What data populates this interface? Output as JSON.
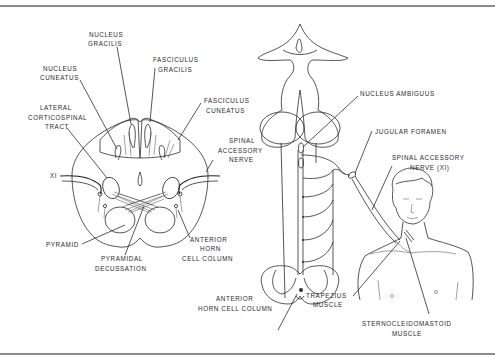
{
  "figure": {
    "type": "anatomical line diagram",
    "panels": [
      "spinal cord cross-section (upper cervical / lower medulla)",
      "brainstem with spinal accessory nerve course",
      "human torso showing trapezius and sternocleidomastoid"
    ]
  },
  "labels": {
    "nucleus_gracilis": [
      "NUCLEUS",
      "GRACILIS"
    ],
    "fasciculus_gracilis": [
      "FASCICULUS",
      "GRACILIS"
    ],
    "nucleus_cuneatus": [
      "NUCLEUS",
      "CUNEATUS"
    ],
    "fasciculus_cuneatus": [
      "FASCICULUS",
      "CUNEATUS"
    ],
    "lateral_corticospinal_tract": [
      "LATERAL",
      "CORTICOSPINAL",
      "TRACT"
    ],
    "spinal_accessory_nerve_left": [
      "SPINAL",
      "ACCESSORY",
      "NERVE"
    ],
    "xi": "XI",
    "pyramid": "PYRAMID",
    "pyramidal_decussation": [
      "PYRAMIDAL",
      "DECUSSATION"
    ],
    "anterior_horn_cell_column_left": [
      "ANTERIOR",
      "HORN",
      "CELL COLUMN"
    ],
    "nucleus_ambiguus": "NUCLEUS AMBIGUUS",
    "jugular_foramen": "JUGULAR FORAMEN",
    "spinal_accessory_nerve_right": [
      "SPINAL ACCESSORY",
      "NERVE (XI)"
    ],
    "anterior_horn_cell_column_right": [
      "ANTERIOR",
      "HORN CELL COLUMN"
    ],
    "trapezius_muscle": [
      "TRAPEZIUS",
      "MUSCLE"
    ],
    "sternocleidomastoid_muscle": [
      "STERNOCLEIDOMASTOID",
      "MUSCLE"
    ]
  },
  "colors": {
    "line": "#2b2b2b",
    "rule": "#8a8a8a",
    "background": "#ffffff"
  }
}
